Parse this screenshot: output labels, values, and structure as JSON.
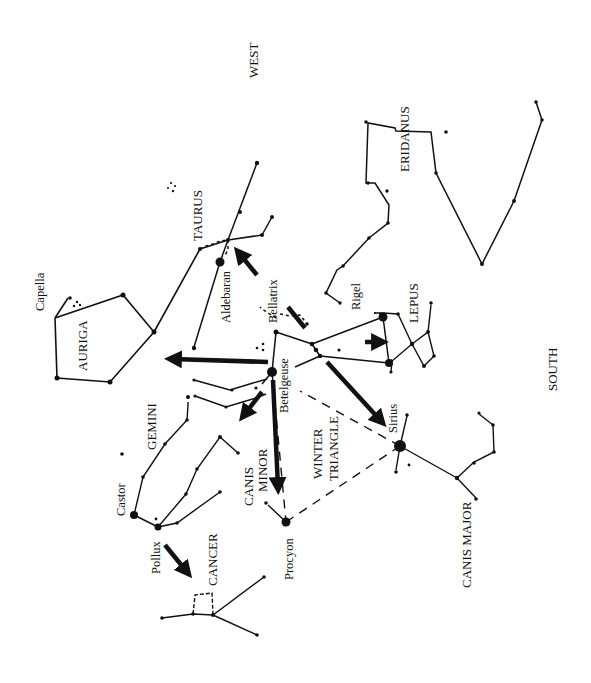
{
  "diagram": {
    "type": "star-chart",
    "orientation_note": "rotated 90 degrees",
    "colors": {
      "ink": "#111111",
      "background": "#ffffff"
    },
    "directions": [
      {
        "id": "west",
        "label": "WEST"
      },
      {
        "id": "south",
        "label": "SOUTH"
      }
    ],
    "constellations": [
      {
        "id": "taurus",
        "label": "TAURUS"
      },
      {
        "id": "auriga",
        "label": "AURIGA"
      },
      {
        "id": "gemini",
        "label": "GEMINI"
      },
      {
        "id": "eridanus",
        "label": "ERIDANUS"
      },
      {
        "id": "lepus",
        "label": "LEPUS"
      },
      {
        "id": "canis-minor",
        "label": "CANIS MINOR",
        "lines": [
          "CANIS",
          "MINOR"
        ]
      },
      {
        "id": "winter-triangle",
        "label": "WINTER TRIANGLE",
        "lines": [
          "WINTER",
          "TRIANGLE"
        ]
      },
      {
        "id": "canis-major",
        "label": "CANIS MAJOR"
      },
      {
        "id": "cancer",
        "label": "CANCER"
      }
    ],
    "stars": [
      {
        "id": "capella",
        "label": "Capella"
      },
      {
        "id": "aldebaran",
        "label": "Aldebaran"
      },
      {
        "id": "bellatrix",
        "label": "Bellatrix"
      },
      {
        "id": "betelgeuse",
        "label": "Betelgeuse"
      },
      {
        "id": "rigel",
        "label": "Rigel"
      },
      {
        "id": "sirius",
        "label": "Sirius"
      },
      {
        "id": "procyon",
        "label": "Procyon"
      },
      {
        "id": "castor",
        "label": "Castor"
      },
      {
        "id": "pollux",
        "label": "Pollux"
      }
    ],
    "pointer_arrows": [
      {
        "from": "belt",
        "to": "aldebaran"
      },
      {
        "from": "belt",
        "to": "sirius"
      },
      {
        "from": "orion",
        "to": "lepus"
      },
      {
        "from": "betelgeuse",
        "to": "auriga"
      },
      {
        "from": "betelgeuse",
        "to": "gemini"
      },
      {
        "from": "betelgeuse",
        "to": "procyon"
      },
      {
        "from": "pollux",
        "to": "cancer"
      }
    ]
  }
}
